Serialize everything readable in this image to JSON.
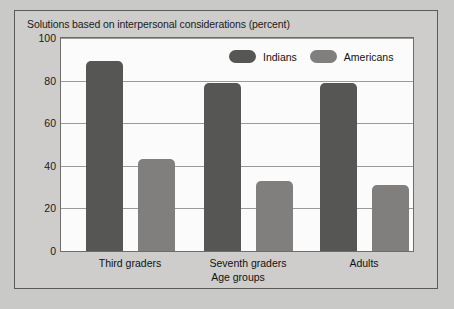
{
  "chart_data": {
    "type": "bar",
    "title": "Solutions based on interpersonal considerations (percent)",
    "xlabel": "Age groups",
    "ylabel": "",
    "categories": [
      "Third graders",
      "Seventh graders",
      "Adults"
    ],
    "series": [
      {
        "name": "Indians",
        "values": [
          89,
          79,
          79
        ],
        "color": "#565655"
      },
      {
        "name": "Americans",
        "values": [
          43,
          33,
          31
        ],
        "color": "#807f7e"
      }
    ],
    "ylim": [
      0,
      100
    ],
    "yticks": [
      0,
      20,
      40,
      60,
      80,
      100
    ],
    "ytick_labels": [
      "0",
      "20",
      "40",
      "60",
      "80",
      "100"
    ],
    "grid": true,
    "legend_position": "top-right",
    "plot_background": "#fbfbfb",
    "panel_background": "#cecdcb"
  }
}
